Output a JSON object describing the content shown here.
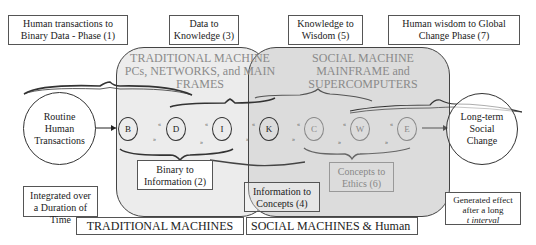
{
  "top_labels": {
    "phase1": "Human transactions to Binary Data - Phase (1)",
    "phase3": "Data to Knowledge (3)",
    "phase5": "Knowledge to Wisdom (5)",
    "phase7": "Human wisdom to Global Change Phase (7)"
  },
  "regions": {
    "traditional": {
      "title_line1": "TRADITIONAL MACHINE",
      "title_line2": "PCs, NETWORKS, and MAIN",
      "title_line3": "FRAMES",
      "fill": "#ececec"
    },
    "social": {
      "title_line1": "SOCIAL MACHINE",
      "title_line2": "MAINFRAME and",
      "title_line3": "SUPERCOMPUTERS",
      "fill": "#dedede"
    }
  },
  "circles": {
    "left_line1": "Routine",
    "left_line2": "Human",
    "left_line3": "Transactions",
    "right_line1": "Long-term",
    "right_line2": "Social",
    "right_line3": "Change"
  },
  "nodes": [
    "B",
    "D",
    "I",
    "K",
    "C",
    "W",
    "E"
  ],
  "node_separator": "«",
  "node_separator_low": "»",
  "inner_labels": {
    "phase2_line1": "Binary to",
    "phase2_line2": "Information (2)",
    "phase4_line1": "Information to",
    "phase4_line2": "Concepts (4)",
    "phase6_line1": "Concepts to",
    "phase6_line2": "Ethics (6)"
  },
  "bottom_labels": {
    "integrated_line1": "Integrated over",
    "integrated_line2": "a Duration of Time",
    "traditional": "TRADITIONAL MACHINES",
    "social": "SOCIAL MACHINES & Human",
    "generated_line1": "Generated effect",
    "generated_line2": "after a long",
    "generated_line3": "t interval"
  }
}
